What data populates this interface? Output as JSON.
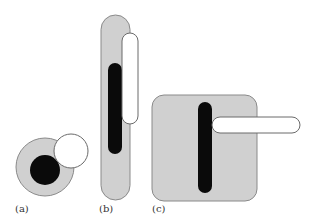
{
  "colors": {
    "gray_fill": "#d0d0d0",
    "gray_stroke": "#8a8a8a",
    "black_fill": "#0a0a0a",
    "white_fill": "#ffffff",
    "white_stroke": "#6a6a6a"
  },
  "panels": [
    {
      "id": "a",
      "label": "(a)",
      "shape": "circle"
    },
    {
      "id": "b",
      "label": "(b)",
      "shape": "vertical-capsule"
    },
    {
      "id": "c",
      "label": "(c)",
      "shape": "rounded-square"
    }
  ]
}
